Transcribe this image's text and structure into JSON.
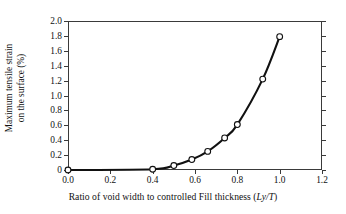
{
  "chart_data": {
    "type": "line",
    "title": "",
    "xlabel": "Ratio of void width to controlled Fill thickness (Ly/T)",
    "xlabel_prefix": "Ratio of void width to controlled Fill thickness (",
    "xlabel_italic": "Ly/T",
    "xlabel_suffix": ")",
    "ylabel_line1": "Maximum tensile strain",
    "ylabel_line2": "on the surface (%)",
    "xlim": [
      0.0,
      1.2
    ],
    "ylim": [
      0.0,
      2.0
    ],
    "grid": false,
    "legend": "none",
    "marker": "open-circle",
    "line_color": "#111111",
    "marker_fill": "#ffffff",
    "xticks": [
      "0.0",
      "0.2",
      "0.4",
      "0.6",
      "0.8",
      "1.0",
      "1.2"
    ],
    "xtick_values": [
      0.0,
      0.2,
      0.4,
      0.6,
      0.8,
      1.0,
      1.2
    ],
    "yticks": [
      "0",
      "0.2",
      "0.4",
      "0.6",
      "0.8",
      "1.0",
      "1.2",
      "1.4",
      "1.6",
      "1.8",
      "2.0"
    ],
    "ytick_values": [
      0.0,
      0.2,
      0.4,
      0.6,
      0.8,
      1.0,
      1.2,
      1.4,
      1.6,
      1.8,
      2.0
    ],
    "x": [
      0.0,
      0.4,
      0.5,
      0.585,
      0.66,
      0.74,
      0.8,
      0.92,
      1.0
    ],
    "values": [
      0.0,
      0.01,
      0.06,
      0.14,
      0.25,
      0.43,
      0.61,
      1.22,
      1.79
    ],
    "series": [
      {
        "name": "Maximum tensile strain on the surface",
        "x": [
          0.0,
          0.4,
          0.5,
          0.585,
          0.66,
          0.74,
          0.8,
          0.92,
          1.0
        ],
        "values": [
          0.0,
          0.01,
          0.06,
          0.14,
          0.25,
          0.43,
          0.61,
          1.22,
          1.79
        ]
      }
    ]
  }
}
